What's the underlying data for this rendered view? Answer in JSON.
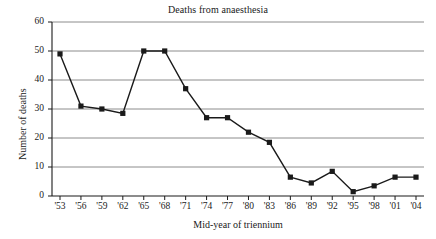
{
  "chart_data": {
    "type": "line",
    "title": "Deaths from anaesthesia",
    "xlabel": "Mid-year of triennium",
    "ylabel": "Number of deaths",
    "categories": [
      "'53",
      "'56",
      "'59",
      "'62",
      "'65",
      "'68",
      "'71",
      "'74",
      "'77",
      "'80",
      "'83",
      "'86",
      "'89",
      "'92",
      "'95",
      "'98",
      "'01",
      "'04"
    ],
    "values": [
      49,
      31,
      30,
      28.5,
      50,
      50,
      37,
      27,
      27,
      22,
      18.5,
      6.5,
      4.5,
      8.5,
      1.5,
      3.5,
      6.5,
      6.5
    ],
    "series": [
      {
        "name": "Number of deaths",
        "values": [
          49,
          31,
          30,
          28.5,
          50,
          50,
          37,
          27,
          27,
          22,
          18.5,
          6.5,
          4.5,
          8.5,
          1.5,
          3.5,
          6.5,
          6.5
        ]
      }
    ],
    "ylim": [
      0,
      60
    ],
    "yticks": [
      0,
      10,
      20,
      30,
      40,
      50,
      60
    ],
    "ytick_labels": [
      "0",
      "10",
      "20",
      "30",
      "40",
      "50",
      "60"
    ],
    "xtick_labels": [
      "'53",
      "'56",
      "'59",
      "'62",
      "'65",
      "'68",
      "'71",
      "'74",
      "'77",
      "'80",
      "'83",
      "'86",
      "'89",
      "'92",
      "'95",
      "'98",
      "'01",
      "'04"
    ],
    "grid": true,
    "grid_axis": "y",
    "legend": "none",
    "marker": "square",
    "line_color": "#1a1a1a",
    "marker_color": "#1a1a1a",
    "grid_color": "#808080",
    "axis_color": "#1a1a1a",
    "background_color": "#ffffff"
  }
}
